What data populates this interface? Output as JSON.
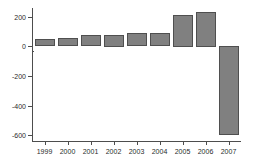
{
  "chart_data": {
    "type": "bar",
    "title": "",
    "subtitle": "",
    "xlabel": "",
    "ylabel": "",
    "categories": [
      "1999",
      "2000",
      "2001",
      "2002",
      "2003",
      "2004",
      "2005",
      "2006",
      "2007"
    ],
    "values": [
      50,
      55,
      75,
      80,
      90,
      90,
      215,
      235,
      -605
    ],
    "series": [
      {
        "name": "",
        "values": [
          50,
          55,
          75,
          80,
          90,
          90,
          215,
          235,
          -605
        ]
      }
    ],
    "ylim": [
      -640,
      260
    ],
    "yticks": [
      200,
      0,
      -200,
      -400,
      -600
    ],
    "ytick_labels": [
      "200",
      "0",
      "-200",
      "-400",
      "-600"
    ],
    "xtick_labels": [
      "1999",
      "2000",
      "2001",
      "2002",
      "2003",
      "2004",
      "2005",
      "2006",
      "2007"
    ],
    "grid": false,
    "legend": false,
    "legend_position": "none",
    "annotations": [],
    "bar_color": "#808080",
    "bar_edge_color": "#4f4f4f",
    "axis_color": "#4d4d4d",
    "background_color": "#ffffff",
    "text_color": "#2b2b2b"
  }
}
